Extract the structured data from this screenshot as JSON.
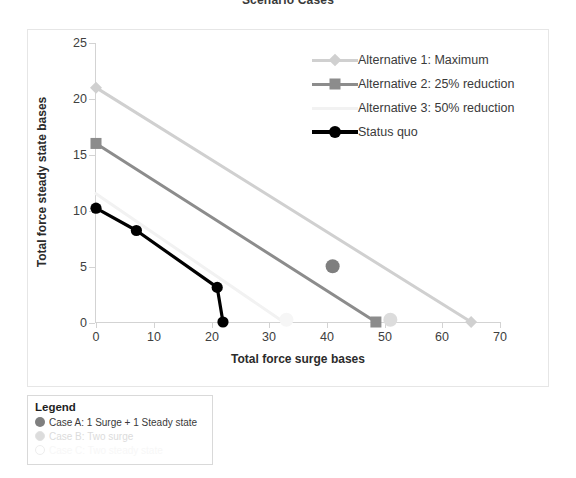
{
  "chart_title": "Scenario Cases",
  "axes": {
    "x_title": "Total force surge bases",
    "y_title": "Total force steady state bases",
    "x_ticks": [
      "0",
      "10",
      "20",
      "30",
      "40",
      "50",
      "60",
      "70"
    ],
    "y_ticks": [
      "25",
      "20",
      "15",
      "10",
      "5",
      "0"
    ]
  },
  "legend": {
    "items": [
      {
        "label": "Alternative 1: Maximum",
        "color": "#d0d0d0",
        "marker": "diamond"
      },
      {
        "label": "Alternative 2: 25% reduction",
        "color": "#8c8c8c",
        "marker": "square"
      },
      {
        "label": "Alternative 3: 50% reduction",
        "color": "#f2f2f2",
        "marker": "none"
      },
      {
        "label": "Status quo",
        "color": "#000000",
        "marker": "circle"
      }
    ]
  },
  "bottom_legend": {
    "title": "Legend",
    "items": [
      {
        "label": "Case A: 1 Surge + 1 Steady state",
        "color": "#7f7f7f",
        "filled": true
      },
      {
        "label": "Case B: Two surge",
        "color": "#dcdcdc",
        "filled": true
      },
      {
        "label": "Case C: Two steady state",
        "color": "#f4f4f4",
        "filled": false
      }
    ]
  },
  "chart_data": {
    "type": "line",
    "title": "Scenario Cases",
    "xlabel": "Total force surge bases",
    "ylabel": "Total force steady state bases",
    "xlim": [
      0,
      70
    ],
    "ylim": [
      0,
      25
    ],
    "xticks": [
      0,
      10,
      20,
      30,
      40,
      50,
      60,
      70
    ],
    "yticks": [
      0,
      5,
      10,
      15,
      20,
      25
    ],
    "grid": false,
    "legend_position": "upper right inside plot",
    "series": [
      {
        "name": "Alternative 1: Maximum",
        "color": "#d0d0d0",
        "marker": "diamond",
        "points": [
          [
            0,
            21
          ],
          [
            65,
            0
          ]
        ]
      },
      {
        "name": "Alternative 2: 25% reduction",
        "color": "#8c8c8c",
        "marker": "square",
        "points": [
          [
            0,
            16
          ],
          [
            48.5,
            0
          ]
        ]
      },
      {
        "name": "Alternative 3: 50% reduction",
        "color": "#f2f2f2",
        "marker": "none",
        "points": [
          [
            0,
            11.5
          ],
          [
            32.5,
            0
          ]
        ]
      },
      {
        "name": "Status quo",
        "color": "#000000",
        "marker": "circle",
        "points": [
          [
            0,
            10.2
          ],
          [
            7,
            8.2
          ],
          [
            21,
            3.1
          ],
          [
            22,
            0
          ]
        ]
      }
    ],
    "scatter_points": [
      {
        "name": "Case A: 1 Surge + 1 Steady state",
        "x": 41,
        "y": 5,
        "color": "#7f7f7f"
      },
      {
        "name": "Case B: Two surge",
        "x": 51,
        "y": 0.2,
        "color": "#dcdcdc"
      },
      {
        "name": "Case C: Two steady state",
        "x": 33,
        "y": 0.2,
        "color": "#f6f6f6"
      }
    ]
  }
}
